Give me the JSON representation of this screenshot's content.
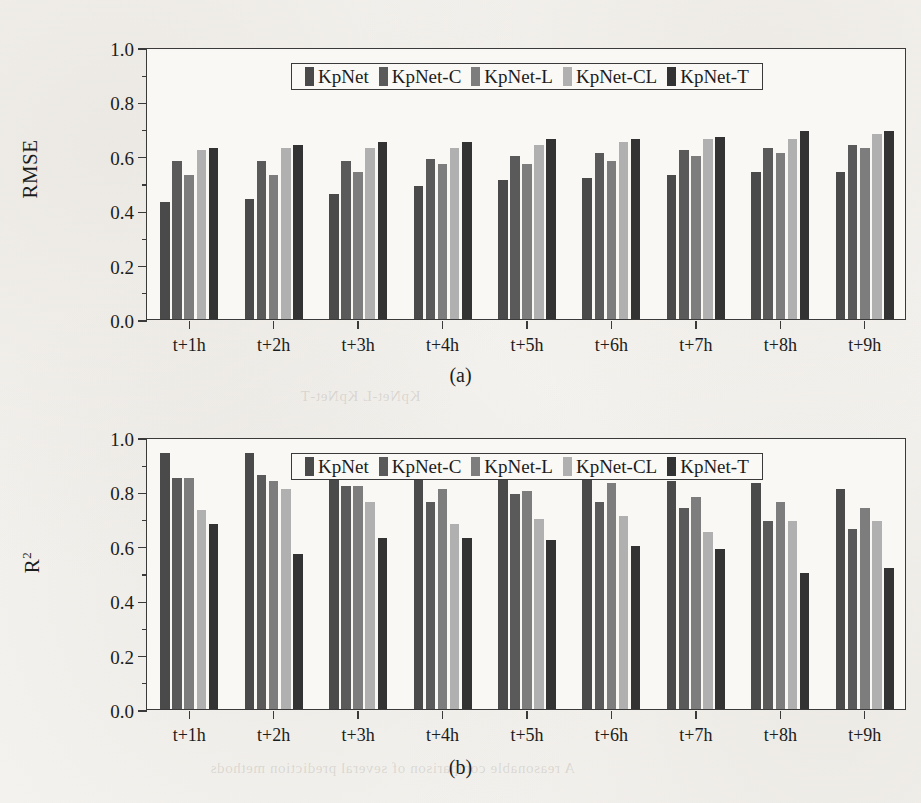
{
  "figure": {
    "background_color": "#f4f2ee",
    "axis_color": "#3a3a3a"
  },
  "series_colors": {
    "KpNet": "#4a4a4a",
    "KpNet-C": "#5a5a5a",
    "KpNet-L": "#7d7d7d",
    "KpNet-CL": "#b0b0b0",
    "KpNet-T": "#333333"
  },
  "legend": {
    "items": [
      {
        "label": "KpNet",
        "color": "#4a4a4a"
      },
      {
        "label": "KpNet-C",
        "color": "#5a5a5a"
      },
      {
        "label": "KpNet-L",
        "color": "#7d7d7d"
      },
      {
        "label": "KpNet-CL",
        "color": "#b0b0b0"
      },
      {
        "label": "KpNet-T",
        "color": "#333333"
      }
    ]
  },
  "captions": {
    "a": "(a)",
    "b": "(b)"
  },
  "ghost_text": {
    "top": "KpNet-L KpNet-T",
    "bottom": "A reasonable comparison of several prediction methods"
  },
  "chart_data": [
    {
      "type": "bar",
      "panel": "a",
      "title": "",
      "xlabel": "",
      "ylabel": "RMSE",
      "ylim": [
        0.0,
        1.0
      ],
      "ytick_labels": [
        "0.0",
        "0.2",
        "0.4",
        "0.6",
        "0.8",
        "1.0"
      ],
      "ytick_values": [
        0.0,
        0.2,
        0.4,
        0.6,
        0.8,
        1.0
      ],
      "yminor_step": 0.1,
      "grid": false,
      "legend_position": "top-center",
      "categories": [
        "t+1h",
        "t+2h",
        "t+3h",
        "t+4h",
        "t+5h",
        "t+6h",
        "t+7h",
        "t+8h",
        "t+9h"
      ],
      "series": [
        {
          "name": "KpNet",
          "values": [
            0.43,
            0.44,
            0.46,
            0.49,
            0.51,
            0.52,
            0.53,
            0.54,
            0.54
          ]
        },
        {
          "name": "KpNet-C",
          "values": [
            0.58,
            0.58,
            0.58,
            0.59,
            0.6,
            0.61,
            0.62,
            0.63,
            0.64
          ]
        },
        {
          "name": "KpNet-L",
          "values": [
            0.53,
            0.53,
            0.54,
            0.57,
            0.57,
            0.58,
            0.6,
            0.61,
            0.63
          ]
        },
        {
          "name": "KpNet-CL",
          "values": [
            0.62,
            0.63,
            0.63,
            0.63,
            0.64,
            0.65,
            0.66,
            0.66,
            0.68
          ]
        },
        {
          "name": "KpNet-T",
          "values": [
            0.63,
            0.64,
            0.65,
            0.65,
            0.66,
            0.66,
            0.67,
            0.69,
            0.69
          ]
        }
      ]
    },
    {
      "type": "bar",
      "panel": "b",
      "title": "",
      "xlabel": "",
      "ylabel": "R²",
      "ylim": [
        0.0,
        1.0
      ],
      "ytick_labels": [
        "0.0",
        "0.2",
        "0.4",
        "0.6",
        "0.8",
        "1.0"
      ],
      "ytick_values": [
        0.0,
        0.2,
        0.4,
        0.6,
        0.8,
        1.0
      ],
      "yminor_step": 0.1,
      "grid": false,
      "legend_position": "top-center",
      "categories": [
        "t+1h",
        "t+2h",
        "t+3h",
        "t+4h",
        "t+5h",
        "t+6h",
        "t+7h",
        "t+8h",
        "t+9h"
      ],
      "series": [
        {
          "name": "KpNet",
          "values": [
            0.94,
            0.94,
            0.92,
            0.89,
            0.89,
            0.89,
            0.84,
            0.83,
            0.81
          ]
        },
        {
          "name": "KpNet-C",
          "values": [
            0.85,
            0.86,
            0.82,
            0.76,
            0.79,
            0.76,
            0.74,
            0.69,
            0.66
          ]
        },
        {
          "name": "KpNet-L",
          "values": [
            0.85,
            0.84,
            0.82,
            0.81,
            0.8,
            0.83,
            0.78,
            0.76,
            0.74
          ]
        },
        {
          "name": "KpNet-CL",
          "values": [
            0.73,
            0.81,
            0.76,
            0.68,
            0.7,
            0.71,
            0.65,
            0.69,
            0.69
          ]
        },
        {
          "name": "KpNet-T",
          "values": [
            0.68,
            0.57,
            0.63,
            0.63,
            0.62,
            0.6,
            0.59,
            0.5,
            0.52
          ]
        }
      ]
    }
  ]
}
